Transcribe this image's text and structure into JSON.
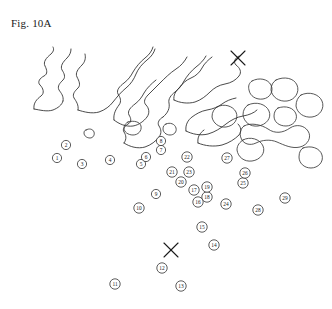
{
  "figure": {
    "caption": "Fig. 10A",
    "background_color": "#ffffff",
    "line_color": "#2b2b2b",
    "width": 332,
    "height": 309
  },
  "chart_data": {
    "type": "scatter",
    "title": "Fig. 10A",
    "xlabel": "",
    "ylabel": "",
    "xlim": [
      0,
      332
    ],
    "ylim": [
      0,
      309
    ],
    "grid": false,
    "legend": null,
    "markers": [
      {
        "label": "1",
        "x": 57,
        "y": 158
      },
      {
        "label": "2",
        "x": 66,
        "y": 145
      },
      {
        "label": "3",
        "x": 82,
        "y": 164
      },
      {
        "label": "4",
        "x": 110,
        "y": 160
      },
      {
        "label": "5",
        "x": 141,
        "y": 164
      },
      {
        "label": "6",
        "x": 146,
        "y": 157
      },
      {
        "label": "7",
        "x": 161,
        "y": 150
      },
      {
        "label": "8",
        "x": 161,
        "y": 141
      },
      {
        "label": "9",
        "x": 156,
        "y": 194
      },
      {
        "label": "10",
        "x": 139,
        "y": 208
      },
      {
        "label": "11",
        "x": 115,
        "y": 284
      },
      {
        "label": "12",
        "x": 162,
        "y": 268
      },
      {
        "label": "13",
        "x": 181,
        "y": 286
      },
      {
        "label": "14",
        "x": 214,
        "y": 245
      },
      {
        "label": "15",
        "x": 202,
        "y": 227
      },
      {
        "label": "16",
        "x": 198,
        "y": 202
      },
      {
        "label": "17",
        "x": 194,
        "y": 190
      },
      {
        "label": "18",
        "x": 207,
        "y": 197
      },
      {
        "label": "19",
        "x": 207,
        "y": 187
      },
      {
        "label": "20",
        "x": 181,
        "y": 182
      },
      {
        "label": "21",
        "x": 172,
        "y": 172
      },
      {
        "label": "22",
        "x": 187,
        "y": 157
      },
      {
        "label": "23",
        "x": 189,
        "y": 172
      },
      {
        "label": "24",
        "x": 226,
        "y": 204
      },
      {
        "label": "25",
        "x": 243,
        "y": 183
      },
      {
        "label": "26",
        "x": 245,
        "y": 173
      },
      {
        "label": "27",
        "x": 227,
        "y": 158
      },
      {
        "label": "28",
        "x": 258,
        "y": 210
      },
      {
        "label": "29",
        "x": 285,
        "y": 198
      }
    ],
    "x_marks": [
      {
        "name": "x-mark-upper-right",
        "x": 238,
        "y": 58,
        "size": 11
      },
      {
        "name": "x-mark-lower-center",
        "x": 171,
        "y": 250,
        "size": 11
      }
    ],
    "contour_count": 8,
    "blob_count": 12
  }
}
